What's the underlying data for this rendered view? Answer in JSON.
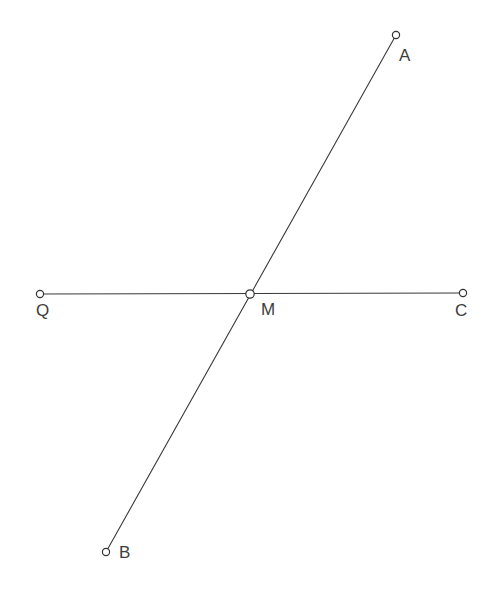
{
  "figure": {
    "width": 496,
    "height": 598,
    "background_color": "#ffffff",
    "stroke_color": "#3a3a3a",
    "label_color": "#3d3d3d",
    "vertex_fill_color": "#ffffff",
    "vertex_stroke_color": "#333333"
  },
  "points": {
    "A": {
      "label": "A",
      "x": 396,
      "y": 35,
      "label_x": 399,
      "label_y": 47,
      "radius": 3.6
    },
    "B": {
      "label": "B",
      "x": 106,
      "y": 552,
      "label_x": 119,
      "label_y": 544,
      "radius": 3.6
    },
    "C": {
      "label": "C",
      "x": 463,
      "y": 293,
      "label_x": 455,
      "label_y": 302,
      "radius": 3.6
    },
    "Q": {
      "label": "Q",
      "x": 40,
      "y": 294,
      "label_x": 36,
      "label_y": 302,
      "radius": 3.6
    },
    "M": {
      "label": "M",
      "x": 250,
      "y": 294,
      "label_x": 261,
      "label_y": 301,
      "radius": 4.2
    }
  },
  "segments": {
    "QC": {
      "name": "segment-QC",
      "x1": 40,
      "y1": 294,
      "x2": 463,
      "y2": 293
    },
    "BA": {
      "name": "segment-BA",
      "x1": 106,
      "y1": 552,
      "x2": 396,
      "y2": 35
    }
  }
}
